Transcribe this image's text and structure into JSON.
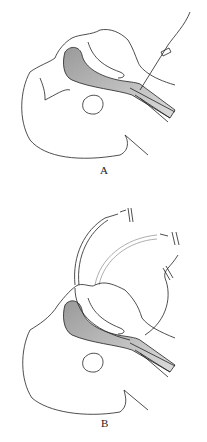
{
  "figure": {
    "panels": [
      {
        "label": "A",
        "description": "Guidewire inserted through the cricothyroid membrane, advanced retrograde up through the larynx and out of the mouth"
      },
      {
        "label": "B",
        "description": "Endotracheal tube threaded over the guidewire and advanced into the trachea"
      }
    ]
  },
  "colors": {
    "line": "#222222",
    "shade": "#bdbdbd",
    "background": "#ffffff"
  }
}
